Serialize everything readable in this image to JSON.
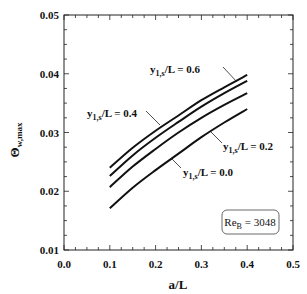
{
  "chart_data": {
    "type": "line",
    "title": "",
    "xlabel": "a/L",
    "ylabel": "Θw,max",
    "xlim": [
      0.0,
      0.5
    ],
    "ylim": [
      0.01,
      0.05
    ],
    "xticks": [
      "0.0",
      "0.1",
      "0.2",
      "0.3",
      "0.4",
      "0.5"
    ],
    "yticks": [
      "0.01",
      "0.02",
      "0.03",
      "0.04",
      "0.05"
    ],
    "grid": false,
    "legend": null,
    "annotation": {
      "text_main": "Re",
      "text_sub": "B",
      "text_rest": " = 3048"
    },
    "x": [
      0.1,
      0.15,
      0.2,
      0.25,
      0.3,
      0.35,
      0.4
    ],
    "series": [
      {
        "name": "y1,s/L = 0.6",
        "label_main": "y",
        "label_sub": "1,s",
        "label_rest": "/L = 0.6",
        "values": [
          0.024,
          0.0274,
          0.0303,
          0.0329,
          0.0355,
          0.0377,
          0.0398
        ]
      },
      {
        "name": "y1,s/L = 0.4",
        "label_main": "y",
        "label_sub": "1,s",
        "label_rest": "/L = 0.4",
        "values": [
          0.0226,
          0.0261,
          0.0291,
          0.0318,
          0.0344,
          0.0367,
          0.0388
        ]
      },
      {
        "name": "y1,s/L = 0.2",
        "label_main": "y",
        "label_sub": "1,s",
        "label_rest": "/L = 0.2",
        "values": [
          0.0207,
          0.0242,
          0.0272,
          0.03,
          0.0325,
          0.0347,
          0.0367
        ]
      },
      {
        "name": "y1,s/L = 0.0",
        "label_main": "y",
        "label_sub": "1,s",
        "label_rest": "/L = 0.0",
        "values": [
          0.0171,
          0.0206,
          0.0236,
          0.0264,
          0.0292,
          0.0317,
          0.034
        ]
      }
    ]
  }
}
